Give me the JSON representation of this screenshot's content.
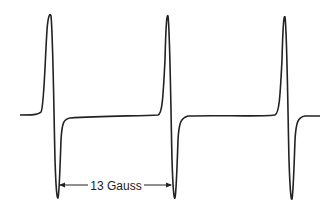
{
  "figure": {
    "type": "EPR first-derivative spectrum",
    "line_count": 3,
    "annotation": {
      "label": "13 Gauss",
      "meaning": "hyperfine splitting between adjacent lines"
    },
    "colors": {
      "background": "#ffffff",
      "trace": "#222222"
    }
  }
}
